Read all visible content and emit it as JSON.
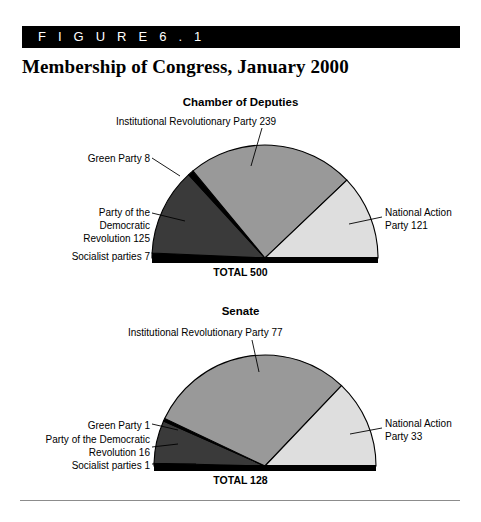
{
  "figure": {
    "banner_label": "F I G U R E   6 . 1",
    "title": "Membership of Congress, January 2000"
  },
  "colors": {
    "pri": "#999999",
    "pan": "#dedede",
    "prd": "#3a3a3a",
    "green": "#000000",
    "socialist": "#000000",
    "baseline": "#000000",
    "stroke": "#000000",
    "footer_rule": "#8c8c8c"
  },
  "charts": [
    {
      "heading": "Chamber of Deputies",
      "total_label": "TOTAL 500",
      "total": 500,
      "geometry": {
        "cx": 265,
        "cy": 258,
        "r": 113
      },
      "heading_top": 96,
      "total_top": 266,
      "labels": [
        {
          "name": "pri-label",
          "text": "Institutional Revolutionary Party 239",
          "left": 116,
          "top": 115,
          "width": 290,
          "align": "l"
        },
        {
          "name": "green-label",
          "text": "Green Party 8",
          "left": 30,
          "top": 152,
          "width": 120,
          "align": "r"
        },
        {
          "name": "prd-label",
          "text": "Party of the\nDemocratic\nRevolution 125",
          "left": 30,
          "top": 206,
          "width": 120,
          "align": "r"
        },
        {
          "name": "socialist-label",
          "text": "Socialist parties 7",
          "left": 18,
          "top": 250,
          "width": 132,
          "align": "r"
        },
        {
          "name": "pan-label",
          "text": "National Action\nParty 121",
          "left": 385,
          "top": 206,
          "width": 100,
          "align": "l"
        }
      ],
      "leaders": [
        {
          "name": "pri-leader",
          "x1": 262,
          "y1": 128,
          "x2": 251,
          "y2": 166
        },
        {
          "name": "green-leader",
          "x1": 152,
          "y1": 158,
          "x2": 180,
          "y2": 176
        },
        {
          "name": "prd-leader",
          "x1": 152,
          "y1": 213,
          "x2": 185,
          "y2": 221
        },
        {
          "name": "socialist-leader",
          "x1": 152,
          "y1": 256,
          "x2": 196,
          "y2": 256
        },
        {
          "name": "pan-leader",
          "x1": 382,
          "y1": 217,
          "x2": 349,
          "y2": 224
        }
      ],
      "slices": [
        {
          "name": "socialist",
          "label": "Socialist parties",
          "value": 7,
          "color_key": "socialist"
        },
        {
          "name": "prd",
          "label": "Party of the Democratic Revolution",
          "value": 125,
          "color_key": "prd"
        },
        {
          "name": "green",
          "label": "Green Party",
          "value": 8,
          "color_key": "green"
        },
        {
          "name": "pri",
          "label": "Institutional Revolutionary Party",
          "value": 239,
          "color_key": "pri"
        },
        {
          "name": "pan",
          "label": "National Action Party",
          "value": 121,
          "color_key": "pan"
        }
      ]
    },
    {
      "heading": "Senate",
      "total_label": "TOTAL 128",
      "total": 128,
      "geometry": {
        "cx": 265,
        "cy": 466,
        "r": 111
      },
      "heading_top": 305,
      "total_top": 474,
      "labels": [
        {
          "name": "pri-label",
          "text": "Institutional Revolutionary Party 77",
          "left": 128,
          "top": 326,
          "width": 280,
          "align": "l"
        },
        {
          "name": "green-label",
          "text": "Green Party 1",
          "left": 30,
          "top": 419,
          "width": 120,
          "align": "r"
        },
        {
          "name": "prd-label",
          "text": "Party of the Democratic\nRevolution 16",
          "left": 12,
          "top": 433,
          "width": 138,
          "align": "r"
        },
        {
          "name": "socialist-label",
          "text": "Socialist parties 1",
          "left": 18,
          "top": 459,
          "width": 132,
          "align": "r"
        },
        {
          "name": "pan-label",
          "text": "National Action\nParty 33",
          "left": 385,
          "top": 417,
          "width": 100,
          "align": "l"
        }
      ],
      "leaders": [
        {
          "name": "pri-leader",
          "x1": 252,
          "y1": 340,
          "x2": 259,
          "y2": 372
        },
        {
          "name": "green-leader",
          "x1": 152,
          "y1": 424,
          "x2": 178,
          "y2": 430
        },
        {
          "name": "prd-leader",
          "x1": 152,
          "y1": 447,
          "x2": 178,
          "y2": 444
        },
        {
          "name": "socialist-leader",
          "x1": 152,
          "y1": 464,
          "x2": 196,
          "y2": 464
        },
        {
          "name": "pan-leader",
          "x1": 382,
          "y1": 428,
          "x2": 350,
          "y2": 434
        }
      ],
      "slices": [
        {
          "name": "socialist",
          "label": "Socialist parties",
          "value": 1,
          "color_key": "socialist"
        },
        {
          "name": "prd",
          "label": "Party of the Democratic Revolution",
          "value": 16,
          "color_key": "prd"
        },
        {
          "name": "green",
          "label": "Green Party",
          "value": 1,
          "color_key": "green"
        },
        {
          "name": "pri",
          "label": "Institutional Revolutionary Party",
          "value": 77,
          "color_key": "pri"
        },
        {
          "name": "pan",
          "label": "National Action Party",
          "value": 33,
          "color_key": "pan"
        }
      ]
    }
  ],
  "chart_data": [
    {
      "type": "pie",
      "title": "Chamber of Deputies",
      "subtitle": "Membership of Congress, January 2000",
      "shape": "semicircle",
      "categories": [
        "Socialist parties",
        "Party of the Democratic Revolution",
        "Green Party",
        "Institutional Revolutionary Party",
        "National Action Party"
      ],
      "values": [
        7,
        125,
        8,
        239,
        121
      ],
      "total": 500,
      "total_label": "TOTAL 500",
      "annotations": [
        "Institutional Revolutionary Party 239",
        "Green Party 8",
        "Party of the Democratic Revolution 125",
        "Socialist parties 7",
        "National Action Party 121"
      ],
      "legend": "none",
      "grid": false
    },
    {
      "type": "pie",
      "title": "Senate",
      "subtitle": "Membership of Congress, January 2000",
      "shape": "semicircle",
      "categories": [
        "Socialist parties",
        "Party of the Democratic Revolution",
        "Green Party",
        "Institutional Revolutionary Party",
        "National Action Party"
      ],
      "values": [
        1,
        16,
        1,
        77,
        33
      ],
      "total": 128,
      "total_label": "TOTAL 128",
      "annotations": [
        "Institutional Revolutionary Party 77",
        "Green Party 1",
        "Party of the Democratic Revolution 16",
        "Socialist parties 1",
        "National Action Party 33"
      ],
      "legend": "none",
      "grid": false
    }
  ]
}
